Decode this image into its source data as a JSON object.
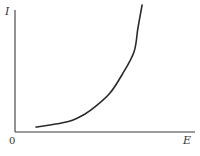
{
  "chart_data": {
    "type": "line",
    "title": "",
    "xlabel": "E",
    "ylabel": "I",
    "origin_label": "0",
    "xlim": [
      0,
      1
    ],
    "ylim": [
      0,
      1
    ],
    "grid": false,
    "legend": "none",
    "units": "normalized (no tick values shown)",
    "series": [
      {
        "name": "I(E)",
        "color": "#2a2a2a",
        "x": [
          0.117,
          0.194,
          0.306,
          0.389,
          0.444,
          0.528,
          0.594,
          0.661,
          0.683,
          0.706
        ],
        "y": [
          0.039,
          0.055,
          0.087,
          0.142,
          0.197,
          0.307,
          0.449,
          0.63,
          0.819,
          1.0
        ]
      }
    ]
  }
}
